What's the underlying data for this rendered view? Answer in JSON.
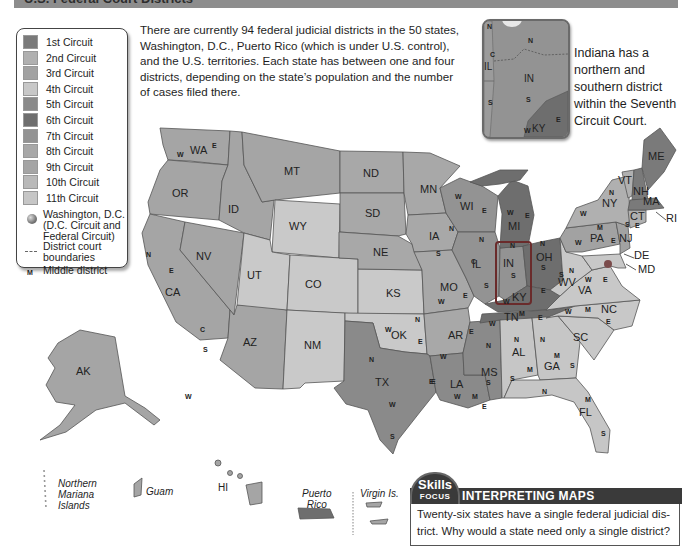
{
  "header": {
    "title": "U.S. Federal Court Districts"
  },
  "intro_text": "There are currently 94 federal judicial districts in the 50 states, Washington, D.C., Puerto Rico (which is under U.S. control), and the U.S. territories. Each state has between one and four districts, depending on the state's population and the number of cases filed there.",
  "intro_lines": [
    "There are currently 94 federal judicial districts in the 50 states,",
    "Washington, D.C., Puerto Rico (which is under U.S. control),",
    "and the U.S. territories. Each state has between one and four",
    "districts, depending on the state’s population and the number",
    "of cases filed there."
  ],
  "legend": {
    "circuits": [
      {
        "label": "1st Circuit",
        "color": "#7a7a7a"
      },
      {
        "label": "2nd Circuit",
        "color": "#b0b0b0"
      },
      {
        "label": "3rd Circuit",
        "color": "#a2a2a2"
      },
      {
        "label": "4th Circuit",
        "color": "#c8c8c8"
      },
      {
        "label": "5th Circuit",
        "color": "#8a8a8a"
      },
      {
        "label": "6th Circuit",
        "color": "#6e6e6e"
      },
      {
        "label": "7th Circuit",
        "color": "#939393"
      },
      {
        "label": "8th Circuit",
        "color": "#a8a8a8"
      },
      {
        "label": "9th Circuit",
        "color": "#a5a5a5"
      },
      {
        "label": "10th Circuit",
        "color": "#b9b9b9"
      },
      {
        "label": "11th Circuit",
        "color": "#c6c6c6"
      }
    ],
    "dc_line1": "Washington, D.C.",
    "dc_line2": "(D.C. Circuit and",
    "dc_line3": "Federal Circuit)",
    "boundary_line1": "District court",
    "boundary_line2": "boundaries",
    "middle_symbol": "M",
    "middle_label": "Middle district"
  },
  "inset": {
    "caption_lines": [
      "Indiana has a",
      "northern and",
      "southern district",
      "within the Seventh",
      "Circuit Court."
    ],
    "labels": {
      "state": "IN",
      "north": "N",
      "south": "S",
      "il": "IL",
      "il_c": "C",
      "il_s": "S",
      "ky": "KY",
      "ky_w": "W",
      "ky_e": "E",
      "mi_n": "N"
    }
  },
  "states": [
    {
      "abbr": "WA",
      "x": 198,
      "y": 151
    },
    {
      "abbr": "OR",
      "x": 180,
      "y": 194
    },
    {
      "abbr": "CA",
      "x": 173,
      "y": 293
    },
    {
      "abbr": "NV",
      "x": 204,
      "y": 257
    },
    {
      "abbr": "ID",
      "x": 236,
      "y": 210
    },
    {
      "abbr": "MT",
      "x": 292,
      "y": 172
    },
    {
      "abbr": "WY",
      "x": 297,
      "y": 227
    },
    {
      "abbr": "UT",
      "x": 255,
      "y": 276
    },
    {
      "abbr": "CO",
      "x": 313,
      "y": 285
    },
    {
      "abbr": "AZ",
      "x": 251,
      "y": 343
    },
    {
      "abbr": "NM",
      "x": 312,
      "y": 346
    },
    {
      "abbr": "ND",
      "x": 371,
      "y": 174
    },
    {
      "abbr": "SD",
      "x": 373,
      "y": 214
    },
    {
      "abbr": "NE",
      "x": 381,
      "y": 253
    },
    {
      "abbr": "KS",
      "x": 394,
      "y": 294
    },
    {
      "abbr": "OK",
      "x": 399,
      "y": 336
    },
    {
      "abbr": "TX",
      "x": 383,
      "y": 383
    },
    {
      "abbr": "MN",
      "x": 428,
      "y": 190
    },
    {
      "abbr": "IA",
      "x": 437,
      "y": 237
    },
    {
      "abbr": "MO",
      "x": 448,
      "y": 288
    },
    {
      "abbr": "AR",
      "x": 456,
      "y": 336
    },
    {
      "abbr": "LA",
      "x": 458,
      "y": 385
    },
    {
      "abbr": "WI",
      "x": 468,
      "y": 207
    },
    {
      "abbr": "IL",
      "x": 480,
      "y": 265
    },
    {
      "abbr": "MI",
      "x": 516,
      "y": 227
    },
    {
      "abbr": "IN",
      "x": 511,
      "y": 264
    },
    {
      "abbr": "OH",
      "x": 544,
      "y": 258
    },
    {
      "abbr": "KY",
      "x": 520,
      "y": 298
    },
    {
      "abbr": "TN",
      "x": 512,
      "y": 318
    },
    {
      "abbr": "MS",
      "x": 489,
      "y": 373
    },
    {
      "abbr": "AL",
      "x": 520,
      "y": 353
    },
    {
      "abbr": "GA",
      "x": 552,
      "y": 367
    },
    {
      "abbr": "FL",
      "x": 587,
      "y": 413
    },
    {
      "abbr": "SC",
      "x": 581,
      "y": 338
    },
    {
      "abbr": "NC",
      "x": 609,
      "y": 310
    },
    {
      "abbr": "VA",
      "x": 586,
      "y": 291
    },
    {
      "abbr": "WV",
      "x": 566,
      "y": 283
    },
    {
      "abbr": "PA",
      "x": 598,
      "y": 239
    },
    {
      "abbr": "NY",
      "x": 610,
      "y": 204
    },
    {
      "abbr": "VT",
      "x": 626,
      "y": 181
    },
    {
      "abbr": "NH",
      "x": 641,
      "y": 192
    },
    {
      "abbr": "ME",
      "x": 656,
      "y": 157
    },
    {
      "abbr": "MA",
      "x": 651,
      "y": 202
    },
    {
      "abbr": "CT",
      "x": 638,
      "y": 217
    },
    {
      "abbr": "NJ",
      "x": 627,
      "y": 239
    },
    {
      "abbr": "AK",
      "x": 84,
      "y": 372
    }
  ],
  "callouts": [
    {
      "abbr": "RI",
      "x": 666,
      "y": 219
    },
    {
      "abbr": "DE",
      "x": 634,
      "y": 256
    },
    {
      "abbr": "MD",
      "x": 638,
      "y": 270
    }
  ],
  "districts": [
    {
      "t": "W",
      "x": 180,
      "y": 155
    },
    {
      "t": "E",
      "x": 215,
      "y": 146
    },
    {
      "t": "N",
      "x": 149,
      "y": 255
    },
    {
      "t": "E",
      "x": 172,
      "y": 271
    },
    {
      "t": "C",
      "x": 203,
      "y": 330
    },
    {
      "t": "S",
      "x": 206,
      "y": 350
    },
    {
      "t": "W",
      "x": 188,
      "y": 397
    },
    {
      "t": "N",
      "x": 372,
      "y": 360
    },
    {
      "t": "W",
      "x": 392,
      "y": 405
    },
    {
      "t": "S",
      "x": 393,
      "y": 437
    },
    {
      "t": "E",
      "x": 434,
      "y": 382
    },
    {
      "t": "W",
      "x": 388,
      "y": 330
    },
    {
      "t": "N",
      "x": 418,
      "y": 320
    },
    {
      "t": "E",
      "x": 421,
      "y": 342
    },
    {
      "t": "W",
      "x": 441,
      "y": 302
    },
    {
      "t": "E",
      "x": 466,
      "y": 296
    },
    {
      "t": "W",
      "x": 443,
      "y": 357
    },
    {
      "t": "E",
      "x": 472,
      "y": 332
    },
    {
      "t": "N",
      "x": 452,
      "y": 229
    },
    {
      "t": "S",
      "x": 439,
      "y": 254
    },
    {
      "t": "W",
      "x": 458,
      "y": 197
    },
    {
      "t": "E",
      "x": 485,
      "y": 211
    },
    {
      "t": "W",
      "x": 510,
      "y": 213
    },
    {
      "t": "E",
      "x": 528,
      "y": 216
    },
    {
      "t": "N",
      "x": 482,
      "y": 240
    },
    {
      "t": "C",
      "x": 474,
      "y": 262
    },
    {
      "t": "S",
      "x": 487,
      "y": 286
    },
    {
      "t": "N",
      "x": 513,
      "y": 246
    },
    {
      "t": "S",
      "x": 514,
      "y": 276
    },
    {
      "t": "N",
      "x": 543,
      "y": 244
    },
    {
      "t": "S",
      "x": 544,
      "y": 268
    },
    {
      "t": "W",
      "x": 506,
      "y": 302
    },
    {
      "t": "E",
      "x": 544,
      "y": 291
    },
    {
      "t": "M",
      "x": 522,
      "y": 314
    },
    {
      "t": "E",
      "x": 541,
      "y": 318
    },
    {
      "t": "W",
      "x": 492,
      "y": 324
    },
    {
      "t": "N",
      "x": 489,
      "y": 346
    },
    {
      "t": "S",
      "x": 489,
      "y": 383
    },
    {
      "t": "E",
      "x": 432,
      "y": 382
    },
    {
      "t": "W",
      "x": 457,
      "y": 397
    },
    {
      "t": "M",
      "x": 475,
      "y": 397
    },
    {
      "t": "E",
      "x": 485,
      "y": 407
    },
    {
      "t": "N",
      "x": 517,
      "y": 340
    },
    {
      "t": "M",
      "x": 530,
      "y": 370
    },
    {
      "t": "S",
      "x": 513,
      "y": 379
    },
    {
      "t": "N",
      "x": 543,
      "y": 340
    },
    {
      "t": "M",
      "x": 557,
      "y": 356
    },
    {
      "t": "S",
      "x": 573,
      "y": 366
    },
    {
      "t": "N",
      "x": 545,
      "y": 392
    },
    {
      "t": "M",
      "x": 588,
      "y": 400
    },
    {
      "t": "S",
      "x": 604,
      "y": 434
    },
    {
      "t": "N",
      "x": 572,
      "y": 271
    },
    {
      "t": "S",
      "x": 562,
      "y": 275
    },
    {
      "t": "W",
      "x": 588,
      "y": 280
    },
    {
      "t": "E",
      "x": 606,
      "y": 280
    },
    {
      "t": "W",
      "x": 568,
      "y": 312
    },
    {
      "t": "M",
      "x": 588,
      "y": 310
    },
    {
      "t": "E",
      "x": 609,
      "y": 322
    },
    {
      "t": "W",
      "x": 578,
      "y": 243
    },
    {
      "t": "M",
      "x": 600,
      "y": 228
    },
    {
      "t": "E",
      "x": 614,
      "y": 241
    },
    {
      "t": "W",
      "x": 583,
      "y": 214
    },
    {
      "t": "N",
      "x": 612,
      "y": 193
    },
    {
      "t": "S",
      "x": 628,
      "y": 225
    },
    {
      "t": "E",
      "x": 638,
      "y": 226
    }
  ],
  "territories": {
    "nmi": [
      "Northern",
      "Mariana",
      "Islands"
    ],
    "guam": "Guam",
    "hi": "HI",
    "pr": [
      "Puerto",
      "Rico"
    ],
    "vi": "Virgin Is."
  },
  "skills_focus": {
    "badge_top": "Skills",
    "badge_bottom": "FOCUS",
    "heading": "INTERPRETING MAPS",
    "line1": "Twenty-six states have a single federal judicial dis-",
    "line2": "trict. Why would a state need only a single district?"
  }
}
